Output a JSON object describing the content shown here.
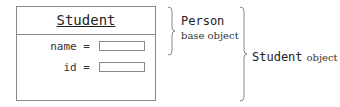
{
  "class_box": {
    "title": "Student",
    "fields": [
      {
        "label": "name =",
        "value": ""
      },
      {
        "label": "id =",
        "value": ""
      }
    ]
  },
  "annotations": {
    "base": {
      "name": "Person",
      "desc": "base object"
    },
    "whole": {
      "name": "Student",
      "desc": "object"
    }
  },
  "colors": {
    "line": "#888888",
    "text": "#222222"
  }
}
